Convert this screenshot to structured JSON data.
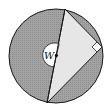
{
  "diagram": {
    "type": "geometry",
    "center_label": "W",
    "colors": {
      "shaded_region": "#9a9a9a",
      "triangle_fill": "#e6e6e6",
      "stroke": "#1a1a1a",
      "center_arc_fill": "#ffffff"
    },
    "circle": {
      "cx": 56,
      "cy": 56,
      "r": 47
    },
    "triangle": {
      "diameter_top": [
        65,
        9
      ],
      "diameter_bottom": [
        47,
        103
      ],
      "right_angle_vertex": [
        102,
        47
      ]
    },
    "right_angle_marker": true
  }
}
